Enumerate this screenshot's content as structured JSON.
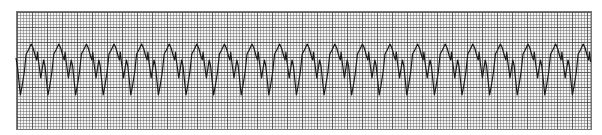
{
  "strip": {
    "type": "ecg-rhythm-strip",
    "grid": {
      "left": 16,
      "top": 11,
      "width": 576,
      "height": 119,
      "small_square_px": 3,
      "large_square_px": 15,
      "background": "#f4f4f4",
      "line_color": "#555555"
    },
    "trace": {
      "color": "#1a1a1a",
      "start_x": 16,
      "baseline_y": 58,
      "period_px": 27.6,
      "complex_count": 21,
      "peak_y": 44,
      "trough_y": 96
    }
  }
}
